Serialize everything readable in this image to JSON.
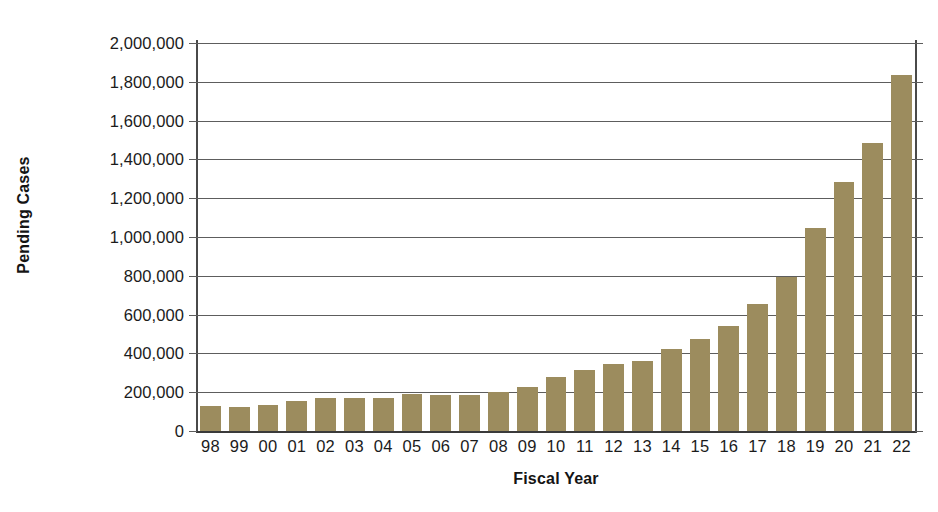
{
  "chart_data": {
    "type": "bar",
    "title": "",
    "xlabel": "Fiscal Year",
    "ylabel": "Pending Cases",
    "categories": [
      "98",
      "99",
      "00",
      "01",
      "02",
      "03",
      "04",
      "05",
      "06",
      "07",
      "08",
      "09",
      "10",
      "11",
      "12",
      "13",
      "14",
      "15",
      "16",
      "17",
      "18",
      "19",
      "20",
      "21",
      "22"
    ],
    "values": [
      130000,
      125000,
      135000,
      155000,
      168000,
      172000,
      170000,
      190000,
      185000,
      186000,
      200000,
      228000,
      280000,
      315000,
      345000,
      360000,
      425000,
      475000,
      540000,
      655000,
      795000,
      1045000,
      1283000,
      1485000,
      1835000
    ],
    "ylim": [
      0,
      2000000
    ],
    "ytick_values": [
      0,
      200000,
      400000,
      600000,
      800000,
      1000000,
      1200000,
      1400000,
      1600000,
      1800000,
      2000000
    ],
    "ytick_labels": [
      "0",
      "200,000",
      "400,000",
      "600,000",
      "800,000",
      "1,000,000",
      "1,200,000",
      "1,400,000",
      "1,600,000",
      "1,800,000",
      "2,000,000"
    ],
    "grid": true,
    "legend": null,
    "bar_color": "#9c8c5e",
    "axis_color": "#4a4a4a",
    "grid_color": "#5d5d5d"
  }
}
